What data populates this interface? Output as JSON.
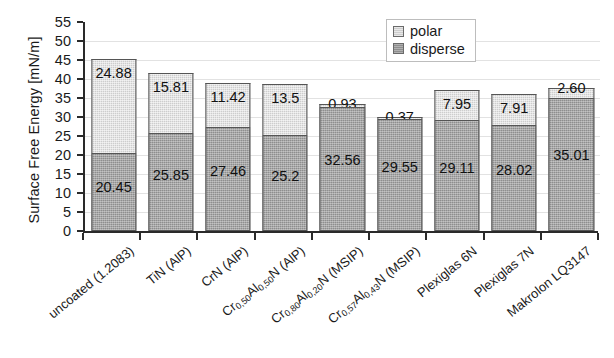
{
  "chart_data": {
    "type": "bar",
    "stacked": true,
    "title": "",
    "xlabel": "",
    "ylabel": "Surface Free Energy [mN/m]",
    "ylim": [
      0,
      55
    ],
    "ytick_step": 5,
    "yticks": [
      "55",
      "50",
      "45",
      "40",
      "35",
      "30",
      "25",
      "20",
      "15",
      "10",
      "5",
      "0"
    ],
    "grid": "horizontal",
    "legend_position": "top-right",
    "categories": [
      "uncoated (1.2083)",
      "TiN (AlP)",
      "CrN (AlP)",
      "Cr<sub>0,50</sub>Al<sub>0,50</sub>N (AlP)",
      "Cr<sub>0,80</sub>Al<sub>0,20</sub>N (MSIP)",
      "Cr<sub>0,57</sub>Al<sub>0,43</sub>N (MSIP)",
      "Plexiglas 6N",
      "Plexiglas 7N",
      "Makrolon LQ3147"
    ],
    "series": [
      {
        "name": "disperse",
        "color": "#8e8e8e",
        "values": [
          20.45,
          25.85,
          27.46,
          25.2,
          32.56,
          29.55,
          29.11,
          28.02,
          35.01
        ],
        "labels": [
          "20.45",
          "25.85",
          "27.46",
          "25.2",
          "32.56",
          "29.55",
          "29.11",
          "28.02",
          "35.01"
        ]
      },
      {
        "name": "polar",
        "color": "#cdcdcd",
        "values": [
          24.88,
          15.81,
          11.42,
          13.5,
          0.93,
          0.37,
          7.95,
          7.91,
          2.6
        ],
        "labels": [
          "24.88",
          "15.81",
          "11.42",
          "13.5",
          "0.93",
          "0.37",
          "7.95",
          "7.91",
          "2.60"
        ]
      }
    ],
    "totals": [
      45.33,
      41.66,
      38.88,
      38.7,
      33.49,
      29.92,
      37.06,
      35.93,
      37.61
    ]
  },
  "legend": {
    "items": [
      {
        "label": "polar",
        "swatch": "polar-swatch"
      },
      {
        "label": "disperse",
        "swatch": "disperse-swatch"
      }
    ]
  },
  "axis": {
    "y_title": "Surface Free Energy [mN/m]"
  }
}
